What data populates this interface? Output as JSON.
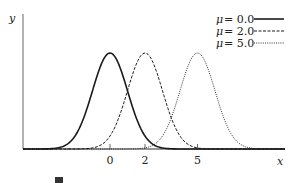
{
  "chart_data": {
    "type": "line",
    "title": "",
    "xlabel": "x",
    "ylabel": "y",
    "x_ticks": [
      {
        "value": 0,
        "label": "0"
      },
      {
        "value": 2,
        "label": "2"
      },
      {
        "value": 5,
        "label": "5"
      }
    ],
    "xlim": [
      -5,
      10
    ],
    "ylim": [
      0,
      1
    ],
    "grid": false,
    "legend_position": "upper right",
    "series": [
      {
        "name": "μ = 0.0",
        "mu": 0.0,
        "sigma": 1.0,
        "style": "solid",
        "peak": 1.0
      },
      {
        "name": "μ = 2.0",
        "mu": 2.0,
        "sigma": 1.0,
        "style": "dashed",
        "peak": 1.0
      },
      {
        "name": "μ = 5.0",
        "mu": 5.0,
        "sigma": 1.0,
        "style": "dotted",
        "peak": 1.0
      }
    ]
  },
  "legend": {
    "entries": [
      {
        "symbol": "μ",
        "eq": "=",
        "value": "0.0",
        "style": "solid"
      },
      {
        "symbol": "μ",
        "eq": "=",
        "value": "2.0",
        "style": "dashed"
      },
      {
        "symbol": "μ",
        "eq": "=",
        "value": "5.0",
        "style": "dotted"
      }
    ]
  },
  "axes": {
    "x_label": "x",
    "y_label": "y"
  },
  "colors": {
    "line": "#1a1a1a",
    "axis": "#555555"
  }
}
